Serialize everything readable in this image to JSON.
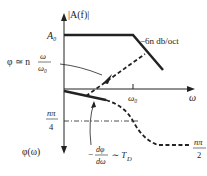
{
  "diagram": {
    "type": "bode-plot-sketch",
    "magnitude": {
      "axis_label": "|A(f)|",
      "level_label": "A₀",
      "rolloff_label": "−6n db/oct"
    },
    "x_axis": {
      "label": "ω",
      "tick_label": "ω₀"
    },
    "phase": {
      "axis_label": "φ(ω)",
      "quarter_label_num": "nπ",
      "quarter_label_den": "4",
      "half_label_num": "nπ",
      "half_label_den": "2"
    },
    "annotations": {
      "phase_approx_prefix": "φ ≃ n",
      "phase_approx_num": "ω",
      "phase_approx_den": "ω₀",
      "group_delay_prefix": "−",
      "group_delay_num": "dφ",
      "group_delay_den": "dω",
      "group_delay_suffix": "∼ T",
      "group_delay_sub": "D"
    },
    "colors": {
      "line": "#222222",
      "background": "#ffffff"
    }
  }
}
